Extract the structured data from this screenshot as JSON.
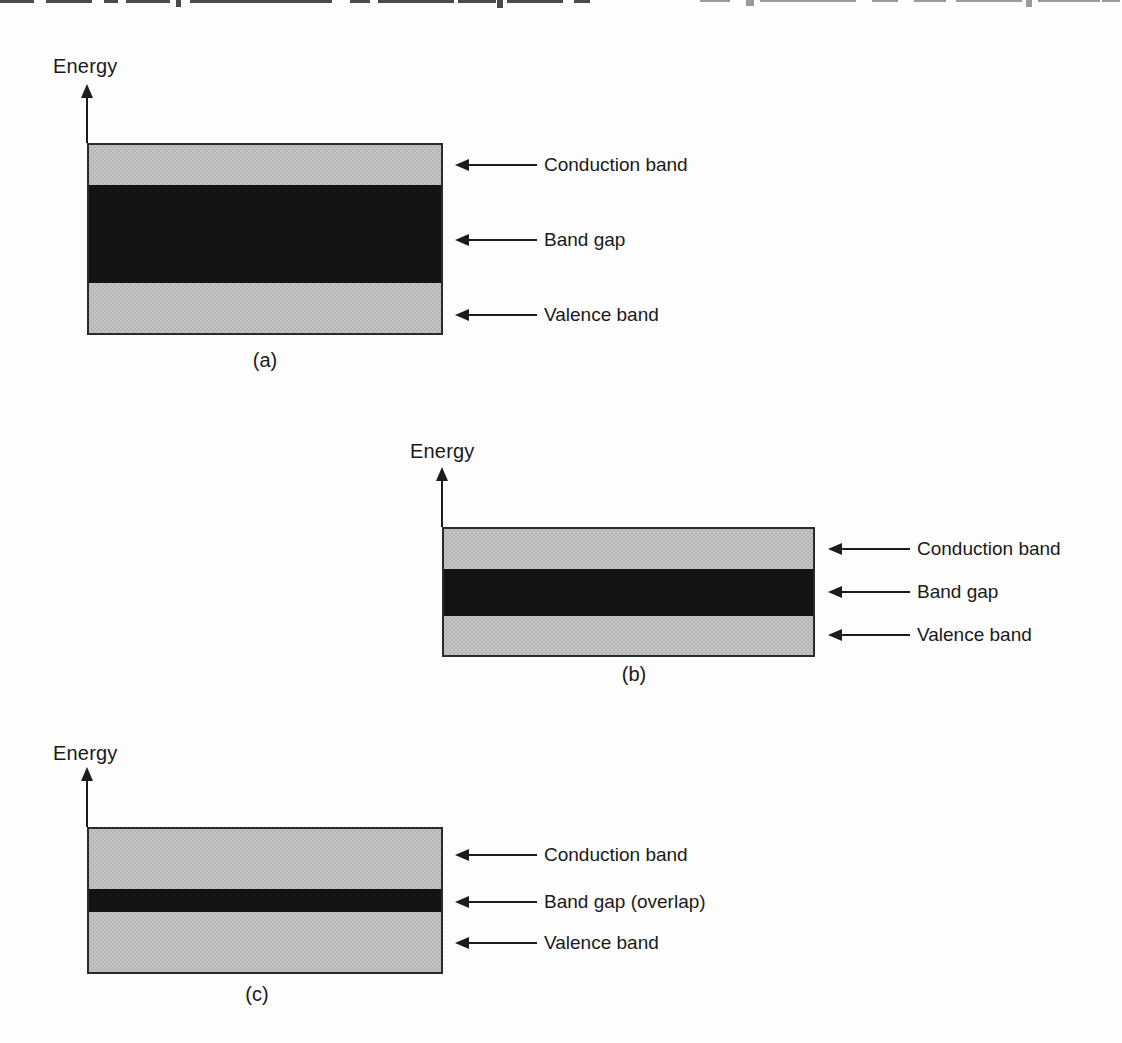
{
  "colors": {
    "background": "#fdfdfd",
    "line": "#1c1c1c",
    "text": "#1a1a1a",
    "band_gray": "#c6c6c6",
    "band_gray_dot": "#a2a2a2",
    "band_black": "#131313"
  },
  "diagrams": [
    {
      "caption": "(a)",
      "axis_label": "Energy",
      "bands": [
        {
          "name": "conduction-band",
          "label": "Conduction band"
        },
        {
          "name": "band-gap",
          "label": "Band gap"
        },
        {
          "name": "valence-band",
          "label": "Valence band"
        }
      ]
    },
    {
      "caption": "(b)",
      "axis_label": "Energy",
      "bands": [
        {
          "name": "conduction-band",
          "label": "Conduction band"
        },
        {
          "name": "band-gap",
          "label": "Band gap"
        },
        {
          "name": "valence-band",
          "label": "Valence band"
        }
      ]
    },
    {
      "caption": "(c)",
      "axis_label": "Energy",
      "bands": [
        {
          "name": "conduction-band",
          "label": "Conduction band"
        },
        {
          "name": "band-gap-overlap",
          "label": "Band gap (overlap)"
        },
        {
          "name": "valence-band",
          "label": "Valence band"
        }
      ]
    }
  ]
}
